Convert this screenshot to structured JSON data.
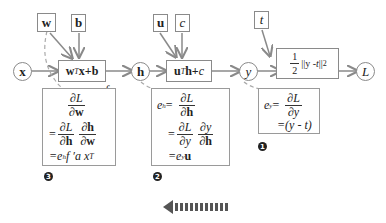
{
  "nodes": {
    "x": "x",
    "h": "h",
    "y": "y",
    "L": "L"
  },
  "params": {
    "w": "w",
    "b": "b",
    "u": "u",
    "c": "c",
    "t": "t"
  },
  "ops": {
    "op1_a": "w",
    "op1_sup": "T",
    "op1_b": "x+b",
    "op2_a": "u",
    "op2_sup": "T",
    "op2_b": " h+",
    "op2_c": "c",
    "loss_num": "1",
    "loss_den": "2",
    "loss_expr_a": "||y - ",
    "loss_expr_t": "t",
    "loss_expr_b": "||",
    "loss_sup": "2",
    "activation": "f",
    "activation_suffix": "a"
  },
  "panels": {
    "p3": {
      "badge": "3",
      "line1_num": "∂L",
      "line1_den": "∂w",
      "eq": "=",
      "line2a_num": "∂L",
      "line2a_den": "∂h",
      "line2b_num": "∂h",
      "line2b_den": "∂w",
      "line3": "=e",
      "line3_sub": "h",
      "line3_rest": "f ′a x",
      "line3_sup": "T"
    },
    "p2": {
      "badge": "2",
      "lhs": "e",
      "lhs_sub": "h",
      "eq": "=",
      "line1_num": "∂L",
      "line1_den": "∂h",
      "line2a_num": "∂L",
      "line2a_den": "∂y",
      "line2b_num": "∂y",
      "line2b_den": "∂h",
      "line3": "=e",
      "line3_sub": "y",
      "line3_rest": "u"
    },
    "p1": {
      "badge": "1",
      "lhs": "e",
      "lhs_sub": "y",
      "eq": "=",
      "line1_num": "∂L",
      "line1_den": "∂y",
      "line2": "=(y - t)"
    }
  },
  "backprop_arrow": {
    "direction": "left",
    "color": "#555555"
  }
}
